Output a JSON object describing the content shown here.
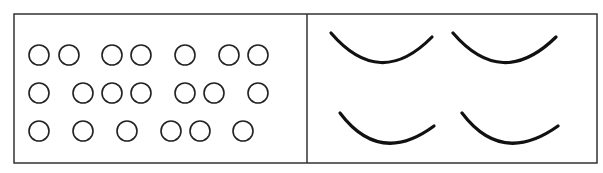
{
  "figure": {
    "width": 603,
    "height": 173,
    "stroke_color": "#222222",
    "background": "#ffffff",
    "frame": {
      "x": 14,
      "y": 14,
      "w": 583,
      "h": 149,
      "divider_x": 307
    },
    "left_panel": {
      "description": "Rows of small open circles grouped irregularly",
      "circle_radius": 10,
      "rows": [
        {
          "y": 55,
          "xs": [
            39,
            69,
            112,
            141,
            185,
            229,
            258
          ]
        },
        {
          "y": 93,
          "xs": [
            39,
            83,
            112,
            141,
            185,
            214,
            258
          ]
        },
        {
          "y": 131,
          "xs": [
            39,
            83,
            127,
            171,
            200,
            243
          ]
        }
      ],
      "circle_count": 20
    },
    "right_panel": {
      "description": "Four thick downward-curving arcs (smile shapes) in a 2x2 arrangement",
      "arcs": [
        {
          "x1": 331,
          "y1": 33,
          "cx": 380,
          "cy": 90,
          "x2": 432,
          "y2": 37
        },
        {
          "x1": 453,
          "y1": 33,
          "cx": 502,
          "cy": 90,
          "x2": 556,
          "y2": 37
        },
        {
          "x1": 340,
          "y1": 113,
          "cx": 380,
          "cy": 166,
          "x2": 434,
          "y2": 126
        },
        {
          "x1": 462,
          "y1": 113,
          "cx": 502,
          "cy": 166,
          "x2": 558,
          "y2": 126
        }
      ]
    }
  }
}
